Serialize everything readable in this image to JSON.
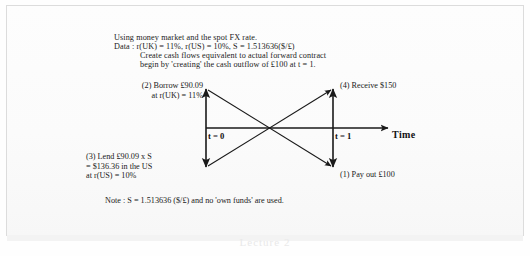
{
  "document": {
    "header_lines": [
      "Using money market and the spot FX rate.",
      "Data : r(UK) = 11%, r(US) = 10%, S = 1.513636($/£)",
      "Create cash flows equivalent to actual forward contract",
      "begin by 'creating' the cash outflow of £100 at t = 1."
    ],
    "note": "Note : S = 1.513636 ($/£) and no 'own funds' are used."
  },
  "diagram": {
    "type": "cash-flow-timeline",
    "axis": {
      "time_label": "Time",
      "t0_label": "t = 0",
      "t1_label": "t = 1"
    },
    "annotations": [
      {
        "id": "borrow",
        "step": "(2)",
        "text": "(2) Borrow £90.09\nat r(UK) = 11%",
        "direction": "inflow",
        "time": "t = 0",
        "currency": "GBP",
        "amount": 90.09,
        "rate": "11%"
      },
      {
        "id": "lend",
        "step": "(3)",
        "text": "(3) Lend £90.09 x S\n= $136.36 in the US\nat r(US) = 10%",
        "direction": "outflow",
        "time": "t = 0",
        "currency": "USD",
        "amount": 136.36,
        "rate": "10%"
      },
      {
        "id": "receive",
        "step": "(4)",
        "text": "(4) Receive $150",
        "direction": "inflow",
        "time": "t = 1",
        "currency": "USD",
        "amount": 150
      },
      {
        "id": "payout",
        "step": "(1)",
        "text": "(1) Pay out £100",
        "direction": "outflow",
        "time": "t = 1",
        "currency": "GBP",
        "amount": 100
      }
    ],
    "colors": {
      "ink": "#191919",
      "page": "#fbfbfb",
      "frame": "#dcdcdc"
    }
  },
  "background_bleed": "Lecture 2"
}
